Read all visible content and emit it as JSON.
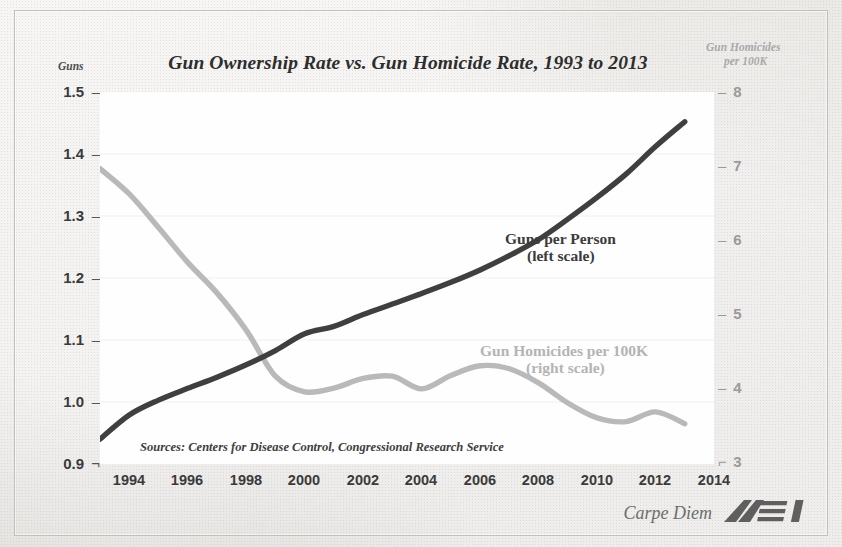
{
  "chart_data": {
    "type": "line",
    "title": "Gun Ownership Rate vs. Gun Homicide Rate, 1993 to 2013",
    "xlabel": "",
    "ylabel": "Guns",
    "y2label": "Gun Homicides per 100K",
    "x": [
      1993,
      1994,
      1995,
      1996,
      1997,
      1998,
      1999,
      2000,
      2001,
      2002,
      2003,
      2004,
      2005,
      2006,
      2007,
      2008,
      2009,
      2010,
      2011,
      2012,
      2013
    ],
    "xlim": [
      1993,
      2014
    ],
    "ylim": [
      0.9,
      1.5
    ],
    "y2lim": [
      3,
      8
    ],
    "grid": true,
    "legend_position": "inside-annotations",
    "xticks_major": [
      1994,
      1996,
      1998,
      2000,
      2002,
      2004,
      2006,
      2008,
      2010,
      2012,
      2014
    ],
    "xticks_minor_every": 1,
    "yticks_left": [
      "1.5",
      "1.4",
      "1.3",
      "1.2",
      "1.1",
      "1.0",
      "0.9"
    ],
    "yticks_right": [
      "8",
      "7",
      "6",
      "5",
      "4",
      "3"
    ],
    "series": [
      {
        "name": "Guns per Person",
        "scale": "left",
        "color": "#3f3f3f",
        "annotation_line1": "Guns per Person",
        "annotation_line2": "(left scale)",
        "values": [
          0.94,
          0.979,
          1.003,
          1.022,
          1.04,
          1.06,
          1.083,
          1.11,
          1.122,
          1.141,
          1.158,
          1.175,
          1.193,
          1.213,
          1.236,
          1.262,
          1.295,
          1.33,
          1.368,
          1.412,
          1.452
        ]
      },
      {
        "name": "Gun Homicides per 100K",
        "scale": "right",
        "color": "#b9b9b9",
        "annotation_line1": "Gun Homicides per 100K",
        "annotation_line2": "(right scale)",
        "values": [
          6.97,
          6.63,
          6.18,
          5.71,
          5.3,
          4.8,
          4.18,
          3.97,
          4.02,
          4.15,
          4.18,
          4.01,
          4.19,
          4.32,
          4.28,
          4.09,
          3.82,
          3.62,
          3.57,
          3.7,
          3.54
        ]
      }
    ],
    "sources_note": "Sources: Centers for Disease Control, Congressional Research Service",
    "credit": "Carpe Diem",
    "brand": "AEI"
  },
  "axes": {
    "left_title": "Guns",
    "right_title_line1": "Gun Homicides",
    "right_title_line2": "per 100K"
  },
  "colors": {
    "guns_line": "#3f3f3f",
    "homicide_line": "#b9b9b9",
    "plot_background": "#fefefe",
    "page_background": "#e8e8e6",
    "title_text": "#2d2d2d"
  }
}
